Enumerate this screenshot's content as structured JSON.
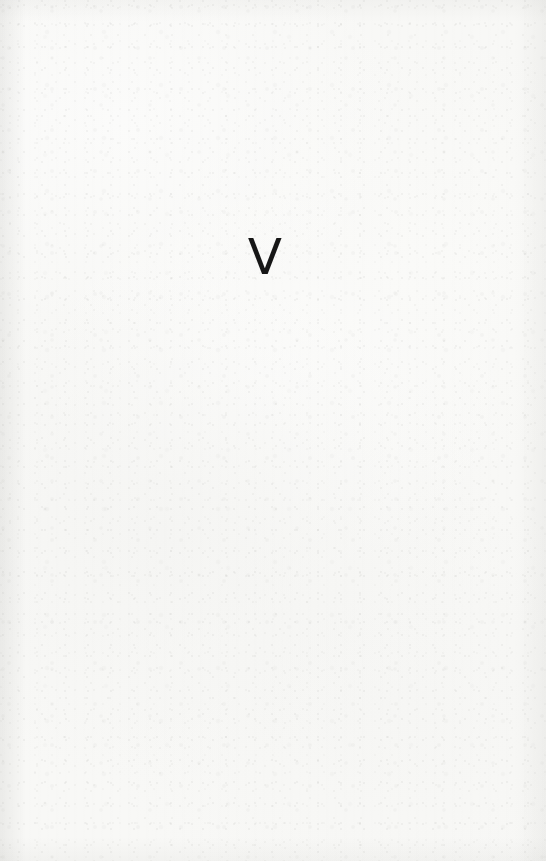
{
  "document": {
    "kind": "scanned-book-page",
    "page_width": 546,
    "page_height": 861,
    "paper_color": "#f8f8f6",
    "ink_color": "#161616",
    "description": "Blank scanned page bearing a single printed character"
  },
  "content": {
    "mark": {
      "text": "V",
      "role": "part-number-roman-numeral",
      "font_size_px": 50,
      "position": {
        "x": 264,
        "y": 264
      }
    }
  },
  "texture": {
    "speckle_opacity": 0.55,
    "grain_opacity": 0.42,
    "streak_opacity": 0.3
  }
}
